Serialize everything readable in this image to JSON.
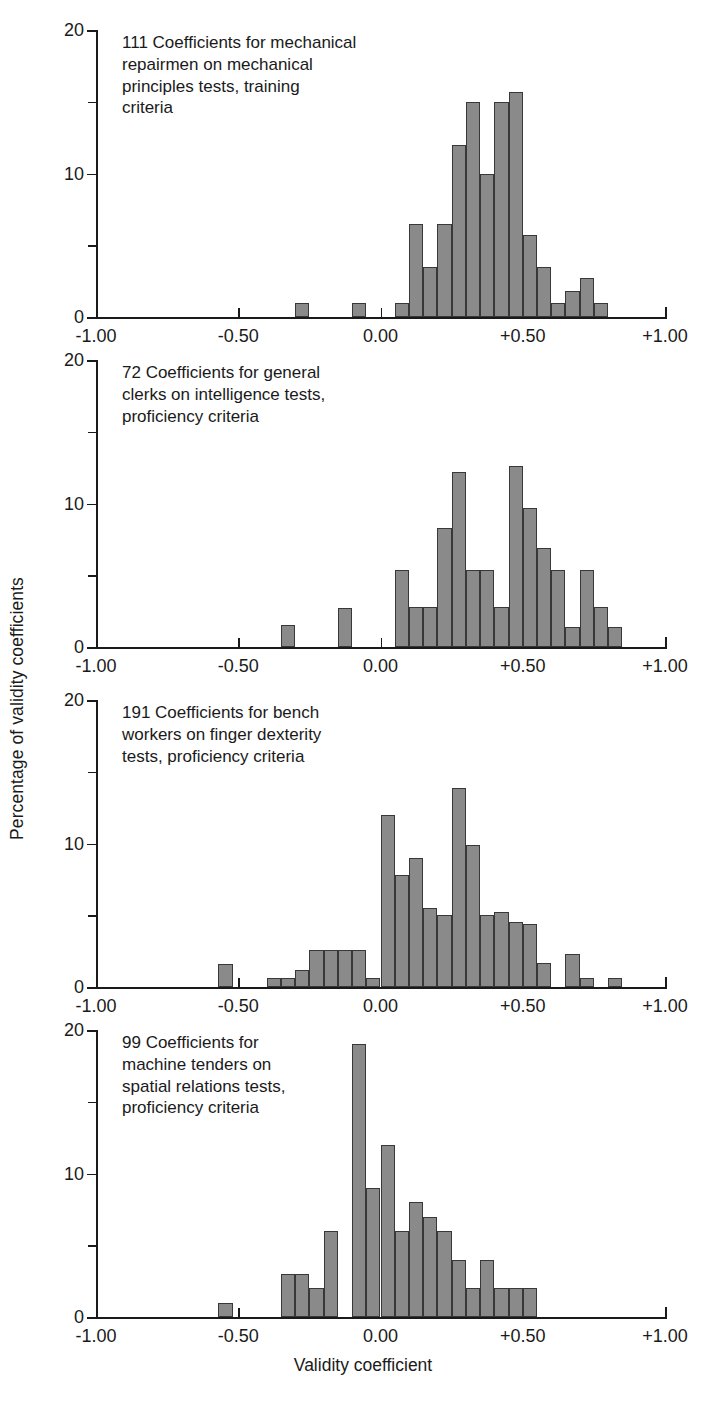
{
  "figure": {
    "ylabel": "Percentage of validity coefficients",
    "xlabel": "Validity coefficient"
  },
  "axis": {
    "x_ticks": [
      "-1.00",
      "-0.50",
      "0.00",
      "+0.50",
      "+1.00"
    ],
    "x_tick_values": [
      -1.0,
      -0.5,
      0.0,
      0.5,
      1.0
    ],
    "y_ticks": [
      "0",
      "10",
      "20"
    ],
    "y_tick_values": [
      0,
      10,
      20
    ],
    "y_minor_values": [
      5,
      15
    ],
    "xlim": [
      -1.0,
      1.0
    ],
    "ylim": [
      0,
      20
    ],
    "bin_width": 0.05
  },
  "style": {
    "bar_fill": "#8a8a8a",
    "bar_stroke": "#383838",
    "axis_color": "#1a1a1a",
    "background": "#ffffff"
  },
  "chart_data": [
    {
      "type": "bar",
      "id": "panel-1",
      "title": "111 Coefficients for mechanical\nrepairmen on mechanical\nprinciples tests, training\ncriteria",
      "xlabel": "Validity coefficient",
      "ylabel": "Percentage of validity coefficients",
      "xlim": [
        -1.0,
        1.0
      ],
      "ylim": [
        0,
        20
      ],
      "grid": false,
      "bin_width": 0.05,
      "bin_starts": [
        -0.3,
        -0.1,
        0.05,
        0.1,
        0.15,
        0.2,
        0.25,
        0.3,
        0.35,
        0.4,
        0.45,
        0.5,
        0.55,
        0.6,
        0.65,
        0.7,
        0.75
      ],
      "values": [
        1.0,
        1.0,
        1.0,
        6.5,
        3.5,
        6.5,
        12.0,
        15.0,
        10.0,
        15.0,
        15.7,
        5.7,
        3.5,
        1.0,
        1.8,
        2.7,
        1.0
      ]
    },
    {
      "type": "bar",
      "id": "panel-2",
      "title": "72 Coefficients for general\nclerks on intelligence tests,\nproficiency criteria",
      "xlabel": "Validity coefficient",
      "ylabel": "Percentage of validity coefficients",
      "xlim": [
        -1.0,
        1.0
      ],
      "ylim": [
        0,
        20
      ],
      "grid": false,
      "bin_width": 0.05,
      "bin_starts": [
        -0.35,
        -0.15,
        0.05,
        0.1,
        0.15,
        0.2,
        0.25,
        0.3,
        0.35,
        0.4,
        0.45,
        0.5,
        0.55,
        0.6,
        0.65,
        0.7,
        0.75,
        0.8
      ],
      "values": [
        1.5,
        2.7,
        5.4,
        2.8,
        2.8,
        8.3,
        12.2,
        5.4,
        5.4,
        2.8,
        12.6,
        9.7,
        6.9,
        5.4,
        1.4,
        5.4,
        2.8,
        1.4
      ]
    },
    {
      "type": "bar",
      "id": "panel-3",
      "title": "191 Coefficients for bench\nworkers on finger dexterity\ntests, proficiency criteria",
      "xlabel": "Validity coefficient",
      "ylabel": "Percentage of validity coefficients",
      "xlim": [
        -1.0,
        1.0
      ],
      "ylim": [
        0,
        20
      ],
      "grid": false,
      "bin_width": 0.05,
      "bin_starts": [
        -0.57,
        -0.4,
        -0.35,
        -0.3,
        -0.25,
        -0.2,
        -0.15,
        -0.1,
        -0.05,
        0.0,
        0.05,
        0.1,
        0.15,
        0.2,
        0.25,
        0.3,
        0.35,
        0.4,
        0.45,
        0.5,
        0.55,
        0.65,
        0.7,
        0.8
      ],
      "values": [
        1.6,
        0.6,
        0.6,
        1.2,
        2.6,
        2.6,
        2.6,
        2.6,
        0.6,
        12.0,
        7.8,
        9.0,
        5.5,
        5.0,
        13.9,
        9.9,
        5.0,
        5.2,
        4.5,
        4.4,
        1.7,
        2.3,
        0.6,
        0.6
      ]
    },
    {
      "type": "bar",
      "id": "panel-4",
      "title": "99 Coefficients for\nmachine tenders on\nspatial relations tests,\nproficiency criteria",
      "xlabel": "Validity coefficient",
      "ylabel": "Percentage of validity coefficients",
      "xlim": [
        -1.0,
        1.0
      ],
      "ylim": [
        0,
        20
      ],
      "grid": false,
      "bin_width": 0.05,
      "bin_starts": [
        -0.57,
        -0.35,
        -0.3,
        -0.25,
        -0.2,
        -0.1,
        -0.05,
        0.0,
        0.05,
        0.1,
        0.15,
        0.2,
        0.25,
        0.3,
        0.35,
        0.4,
        0.45,
        0.5
      ],
      "values": [
        1.0,
        3.0,
        3.0,
        2.0,
        6.0,
        19.0,
        9.0,
        12.0,
        6.0,
        8.0,
        7.0,
        6.0,
        4.0,
        2.0,
        4.0,
        2.0,
        2.0,
        2.0
      ]
    }
  ]
}
